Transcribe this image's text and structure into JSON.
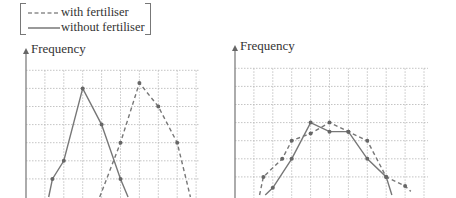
{
  "legend": {
    "dashed_label": "with fertiliser",
    "solid_label": "without fertiliser"
  },
  "chart_data": [
    {
      "type": "line",
      "title": "",
      "ylabel": "Frequency",
      "xlabel": "",
      "grid": true,
      "legend_position": "top-left",
      "x_grid_units": [
        0,
        1,
        2,
        3,
        4,
        5,
        6,
        7,
        8,
        9
      ],
      "y_grid_units": [
        0,
        1,
        2,
        3,
        4,
        5,
        6,
        7
      ],
      "series": [
        {
          "name": "without fertiliser",
          "style": "solid",
          "points": [
            [
              1.2,
              0
            ],
            [
              1.4,
              1
            ],
            [
              2.0,
              2
            ],
            [
              3.0,
              6
            ],
            [
              4.0,
              4
            ],
            [
              5.0,
              1
            ],
            [
              5.4,
              0
            ]
          ]
        },
        {
          "name": "with fertiliser",
          "style": "dashed",
          "points": [
            [
              3.9,
              0
            ],
            [
              5.0,
              3
            ],
            [
              6.0,
              6.3
            ],
            [
              7.0,
              5
            ],
            [
              8.0,
              3
            ],
            [
              8.7,
              0
            ]
          ]
        }
      ]
    },
    {
      "type": "line",
      "title": "",
      "ylabel": "Frequency",
      "xlabel": "",
      "grid": true,
      "x_grid_units": [
        0,
        1,
        2,
        3,
        4,
        5,
        6,
        7,
        8,
        9,
        10
      ],
      "y_grid_units": [
        0,
        1,
        2,
        3,
        4,
        5,
        6,
        7
      ],
      "series": [
        {
          "name": "without fertiliser",
          "style": "solid",
          "points": [
            [
              1.6,
              0
            ],
            [
              2.0,
              0.4
            ],
            [
              3.0,
              2
            ],
            [
              4.0,
              4
            ],
            [
              5.0,
              3.5
            ],
            [
              6.0,
              3.5
            ],
            [
              7.0,
              2
            ],
            [
              8.0,
              1
            ],
            [
              8.3,
              0
            ]
          ]
        },
        {
          "name": "with fertiliser",
          "style": "dashed",
          "points": [
            [
              1.3,
              0
            ],
            [
              1.5,
              1
            ],
            [
              2.5,
              2
            ],
            [
              3.0,
              3
            ],
            [
              4.0,
              3.4
            ],
            [
              5.0,
              4
            ],
            [
              6.0,
              3.5
            ],
            [
              7.0,
              3
            ],
            [
              8.0,
              1
            ],
            [
              9.0,
              0.5
            ],
            [
              9.3,
              0.2
            ]
          ]
        }
      ]
    }
  ],
  "colors": {
    "line": "#777777",
    "marker": "#666666",
    "grid": "#b5b5b5",
    "axis": "#888888",
    "text": "#333333"
  }
}
